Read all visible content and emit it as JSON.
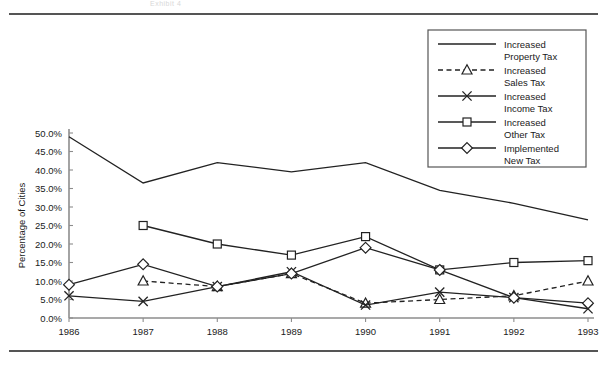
{
  "header": {
    "ghost_text": "Exhibit 4"
  },
  "chart_data": {
    "type": "line",
    "title": "",
    "xlabel": "",
    "ylabel": "Percentage of Cities",
    "categories": [
      "1986",
      "1987",
      "1988",
      "1989",
      "1990",
      "1991",
      "1992",
      "1993"
    ],
    "x": [
      1986,
      1987,
      1988,
      1989,
      1990,
      1991,
      1992,
      1993
    ],
    "ylim": [
      0,
      50
    ],
    "ytick_labels": [
      "0.0%",
      "5.0%",
      "10.0%",
      "15.0%",
      "20.0%",
      "25.0%",
      "30.0%",
      "35.0%",
      "40.0%",
      "45.0%",
      "50.0%"
    ],
    "ytick_values": [
      0,
      5,
      10,
      15,
      20,
      25,
      30,
      35,
      40,
      45,
      50
    ],
    "grid": false,
    "legend_position": "top-right",
    "series": [
      {
        "name": "Increased Property Tax",
        "marker": "none",
        "dash": false,
        "values": [
          49.0,
          36.5,
          42.0,
          39.5,
          42.0,
          34.5,
          31.0,
          26.5
        ]
      },
      {
        "name": "Increased Sales Tax",
        "marker": "triangle",
        "dash": true,
        "values": [
          null,
          10.0,
          8.5,
          12.0,
          4.0,
          5.0,
          6.0,
          10.0
        ]
      },
      {
        "name": "Increased Income Tax",
        "marker": "x",
        "dash": false,
        "values": [
          6.0,
          4.5,
          8.5,
          12.5,
          3.5,
          7.0,
          5.5,
          2.5
        ]
      },
      {
        "name": "Increased Other Tax",
        "marker": "square",
        "dash": false,
        "values": [
          null,
          25.0,
          20.0,
          17.0,
          22.0,
          13.0,
          15.0,
          15.5
        ]
      },
      {
        "name": "Implemented New Tax",
        "marker": "diamond",
        "dash": false,
        "values": [
          9.0,
          14.5,
          8.5,
          12.0,
          19.0,
          13.0,
          5.5,
          4.0
        ]
      }
    ]
  },
  "legend": {
    "items": [
      {
        "label_line1": "Increased",
        "label_line2": "Property Tax",
        "marker": "none",
        "dash": false
      },
      {
        "label_line1": "Increased",
        "label_line2": "Sales Tax",
        "marker": "triangle",
        "dash": true
      },
      {
        "label_line1": "Increased",
        "label_line2": "Income Tax",
        "marker": "x",
        "dash": false
      },
      {
        "label_line1": "Increased",
        "label_line2": "Other Tax",
        "marker": "square",
        "dash": false
      },
      {
        "label_line1": "Implemented",
        "label_line2": "New Tax",
        "marker": "diamond",
        "dash": false
      }
    ]
  }
}
